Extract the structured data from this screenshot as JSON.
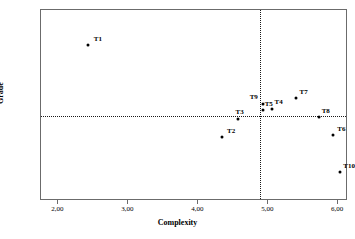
{
  "chart_data": {
    "type": "scatter",
    "title": "",
    "xlabel": "Complexity",
    "ylabel": "Grade",
    "xlim": [
      1.75,
      6.14
    ],
    "ylim": [
      5.5,
      8.7
    ],
    "grid": false,
    "legend": null,
    "x_ticks": [
      "2,00",
      "3,00",
      "4,00",
      "5,00",
      "6,00"
    ],
    "x_tick_values": [
      2.0,
      3.0,
      4.0,
      5.0,
      6.0
    ],
    "y_ticks": [
      "5,50",
      "6,00",
      "6,50",
      "7,00",
      "7,50",
      "8,00",
      "8,50"
    ],
    "y_tick_values": [
      5.5,
      6.0,
      6.5,
      7.0,
      7.5,
      8.0,
      8.5
    ],
    "reference_lines": {
      "horizontal_grade": 6.93,
      "vertical_complexity": 4.88,
      "style": "dotted"
    },
    "point_color": "#000000",
    "axis_color": "#6b6b6b",
    "points": [
      {
        "label": "T1",
        "x": 2.42,
        "y": 8.11,
        "label_dx": 6,
        "label_dy": -9
      },
      {
        "label": "T2",
        "x": 4.34,
        "y": 6.57,
        "label_dx": 5,
        "label_dy": -9
      },
      {
        "label": "T3",
        "x": 4.56,
        "y": 6.88,
        "label_dx": -2,
        "label_dy": -10
      },
      {
        "label": "T9",
        "x": 4.92,
        "y": 7.13,
        "label_dx": -13,
        "label_dy": -10
      },
      {
        "label": "T5",
        "x": 4.92,
        "y": 7.02,
        "label_dx": 2,
        "label_dy": -9
      },
      {
        "label": "T4",
        "x": 5.06,
        "y": 7.04,
        "label_dx": 2,
        "label_dy": -10
      },
      {
        "label": "T7",
        "x": 5.39,
        "y": 7.22,
        "label_dx": 4,
        "label_dy": -9
      },
      {
        "label": "T8",
        "x": 5.72,
        "y": 6.9,
        "label_dx": 3,
        "label_dy": -9
      },
      {
        "label": "T6",
        "x": 5.93,
        "y": 6.6,
        "label_dx": 4,
        "label_dy": -9
      },
      {
        "label": "T10",
        "x": 6.03,
        "y": 5.99,
        "label_dx": 3,
        "label_dy": -9
      }
    ]
  }
}
